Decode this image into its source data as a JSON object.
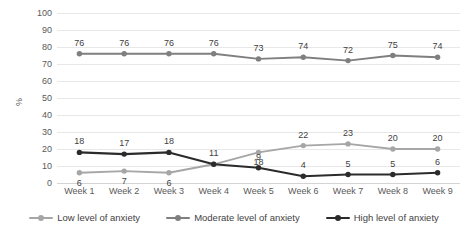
{
  "chart_data": {
    "type": "line",
    "title": "",
    "xlabel": "",
    "ylabel": "%",
    "ylim": [
      0,
      100
    ],
    "ytick_step": 10,
    "grid": true,
    "legend_position": "bottom",
    "categories": [
      "Week 1",
      "Week 2",
      "Week 3",
      "Week 4",
      "Week 5",
      "Week 6",
      "Week 7",
      "Week 8",
      "Week 9"
    ],
    "yticks": [
      "0",
      "10",
      "20",
      "30",
      "40",
      "50",
      "60",
      "70",
      "80",
      "90",
      "100"
    ],
    "series": [
      {
        "name": "Low level of anxiety",
        "color": "#a6a6a6",
        "values": [
          6,
          7,
          6,
          11,
          18,
          22,
          23,
          20,
          20
        ],
        "labels": [
          "6",
          "7",
          "6",
          "11",
          "18",
          "22",
          "23",
          "20",
          "20"
        ]
      },
      {
        "name": "Moderate level of anxiety",
        "color": "#7f7f7f",
        "values": [
          76,
          76,
          76,
          76,
          73,
          74,
          72,
          75,
          74
        ],
        "labels": [
          "76",
          "76",
          "76",
          "76",
          "73",
          "74",
          "72",
          "75",
          "74"
        ]
      },
      {
        "name": "High level of anxiety",
        "color": "#2b2b2b",
        "values": [
          18,
          17,
          18,
          11,
          9,
          4,
          5,
          5,
          6
        ],
        "labels": [
          "18",
          "17",
          "18",
          "11",
          "9",
          "4",
          "5",
          "5",
          "6"
        ]
      }
    ]
  },
  "axis": {
    "y_title": "%"
  },
  "legend": {
    "items": [
      {
        "label": "Low level of anxiety"
      },
      {
        "label": "Moderate level of anxiety"
      },
      {
        "label": "High level of anxiety"
      }
    ]
  }
}
